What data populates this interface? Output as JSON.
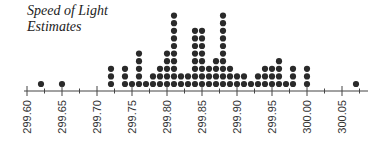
{
  "chart_data": {
    "type": "dot",
    "title": "Speed of Light Estimates",
    "title_lines": [
      "Speed of Light",
      "Estimates"
    ],
    "xlabel": "",
    "ylabel": "",
    "xlim": [
      299.596,
      300.09
    ],
    "major_ticks": [
      299.6,
      299.65,
      299.7,
      299.75,
      299.8,
      299.85,
      299.9,
      299.95,
      300.0,
      300.05
    ],
    "tick_labels": [
      "299.60",
      "299.65",
      "299.70",
      "299.75",
      "299.80",
      "299.85",
      "299.90",
      "299.95",
      "300.00",
      "300.05"
    ],
    "minor_ticks": [
      299.625,
      299.675,
      299.725,
      299.775,
      299.825,
      299.875,
      299.925,
      299.975,
      300.025,
      300.075
    ],
    "grid": false,
    "legend": null,
    "points": [
      {
        "x": 299.62,
        "count": 1
      },
      {
        "x": 299.65,
        "count": 1
      },
      {
        "x": 299.72,
        "count": 3
      },
      {
        "x": 299.74,
        "count": 3
      },
      {
        "x": 299.75,
        "count": 1
      },
      {
        "x": 299.76,
        "count": 5
      },
      {
        "x": 299.77,
        "count": 1
      },
      {
        "x": 299.78,
        "count": 2
      },
      {
        "x": 299.79,
        "count": 3
      },
      {
        "x": 299.8,
        "count": 5
      },
      {
        "x": 299.81,
        "count": 10
      },
      {
        "x": 299.82,
        "count": 2
      },
      {
        "x": 299.83,
        "count": 2
      },
      {
        "x": 299.84,
        "count": 8
      },
      {
        "x": 299.85,
        "count": 8
      },
      {
        "x": 299.86,
        "count": 3
      },
      {
        "x": 299.87,
        "count": 4
      },
      {
        "x": 299.88,
        "count": 10
      },
      {
        "x": 299.89,
        "count": 3
      },
      {
        "x": 299.9,
        "count": 2
      },
      {
        "x": 299.91,
        "count": 2
      },
      {
        "x": 299.92,
        "count": 1
      },
      {
        "x": 299.93,
        "count": 2
      },
      {
        "x": 299.94,
        "count": 3
      },
      {
        "x": 299.95,
        "count": 3
      },
      {
        "x": 299.96,
        "count": 4
      },
      {
        "x": 299.97,
        "count": 1
      },
      {
        "x": 299.98,
        "count": 3
      },
      {
        "x": 300.0,
        "count": 3
      },
      {
        "x": 300.07,
        "count": 1
      }
    ],
    "colors": {
      "dot": "#2a2a2a",
      "axis": "#444444"
    }
  }
}
